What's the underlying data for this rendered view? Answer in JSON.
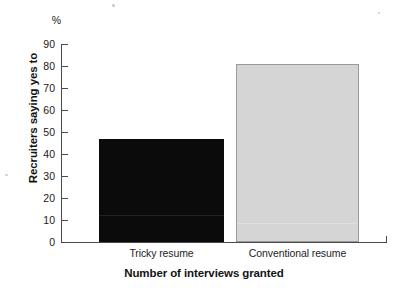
{
  "chart_data": {
    "type": "bar",
    "title": "",
    "categories": [
      "Tricky resume",
      "Conventional resume"
    ],
    "values": [
      47,
      81
    ],
    "xlabel": "Number of interviews granted",
    "ylabel": "Recruiters saying yes to",
    "unit_label": "%",
    "ylim": [
      0,
      90
    ],
    "ytick_values": [
      90,
      80,
      70,
      60,
      50,
      40,
      30,
      20,
      10,
      0
    ],
    "ytick_labels": [
      "90",
      "80",
      "70",
      "60",
      "50",
      "40",
      "30",
      "20",
      "10",
      "0"
    ],
    "grid": false,
    "legend": false,
    "bar_colors": [
      "#0b0b0b",
      "#d5d5d5"
    ],
    "bar_border_colors": [
      "#0b0b0b",
      "#9a9a9a"
    ],
    "axis_color": "#4a4a4a",
    "background_color": "#ffffff"
  }
}
